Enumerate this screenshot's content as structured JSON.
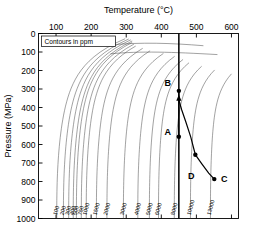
{
  "chart_data": {
    "type": "line",
    "title": "",
    "xlabel": "Temperature (°C)",
    "ylabel": "Pressure (MPa)",
    "xlim": [
      50,
      620
    ],
    "ylim": [
      0,
      1000
    ],
    "y_inverted": true,
    "x_axis_position": "top",
    "grid": false,
    "legend": {
      "text": "Contours in ppm",
      "position": "top-left-inset"
    },
    "xticks": [
      100,
      200,
      300,
      400,
      500,
      600
    ],
    "xtick_labels": [
      "100",
      "200",
      "300",
      "400",
      "500",
      "600"
    ],
    "yticks": [
      0,
      100,
      200,
      300,
      400,
      500,
      600,
      700,
      800,
      900,
      1000
    ],
    "ytick_labels": [
      "0",
      "100",
      "200",
      "300",
      "400",
      "500",
      "600",
      "700",
      "800",
      "900",
      "1000"
    ],
    "contour_units": "ppm",
    "contour_levels": [
      100,
      200,
      300,
      400,
      500,
      750,
      1000,
      1500,
      2000,
      3000,
      4000,
      5000,
      6000,
      8000,
      10000,
      13000
    ],
    "contour_labels": [
      "100",
      "200",
      "300",
      "400",
      "500",
      "750",
      "1000",
      "1500",
      "2000",
      "3000",
      "4000",
      "5000",
      "6000",
      "8000",
      "10000",
      "13000"
    ],
    "contour_label_x": [
      102,
      121,
      136,
      149,
      158,
      172,
      186,
      215,
      245,
      292,
      333,
      366,
      392,
      437,
      483,
      540
    ],
    "annotations": [
      {
        "label": "A",
        "x": 450,
        "y": 558,
        "label_dx": -11,
        "label_dy": -2
      },
      {
        "label": "B",
        "x": 450,
        "y": 310,
        "label_dx": -11,
        "label_dy": -5
      },
      {
        "label": "C",
        "x": 551,
        "y": 787,
        "label_dx": 10,
        "label_dy": 3
      },
      {
        "label": "D",
        "x": 497,
        "y": 655,
        "label_dx": -4,
        "label_dy": 24
      }
    ],
    "series": [
      {
        "name": "isothermal-decompression-A-to-B",
        "style": "solid-with-arrow",
        "points": [
          [
            450,
            558
          ],
          [
            450,
            310
          ]
        ]
      },
      {
        "name": "cooling-path-B-to-C",
        "style": "solid",
        "points": [
          [
            450,
            358
          ],
          [
            458,
            412
          ],
          [
            470,
            478
          ],
          [
            484,
            560
          ],
          [
            497,
            655
          ],
          [
            516,
            706
          ],
          [
            535,
            755
          ],
          [
            551,
            787
          ]
        ]
      }
    ],
    "vertical_marker": {
      "name": "isotherm-450C",
      "x": 450,
      "y_from": 0,
      "y_to": 1000
    }
  }
}
